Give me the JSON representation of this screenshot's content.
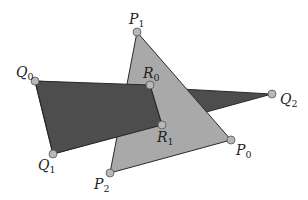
{
  "diagram": {
    "colors": {
      "background": "#ffffff",
      "triangle_p_fill": "#a9a9a9",
      "triangle_q_fill": "#4d4d4d",
      "edge_stroke": "#2a2a2a",
      "vertex_fill": "#b8b8b8",
      "vertex_stroke": "#555555",
      "label_color": "#222222"
    },
    "triangle_q": {
      "name": "Q",
      "vertices": [
        {
          "id": "Q0",
          "x": 35,
          "y": 81
        },
        {
          "id": "Q1",
          "x": 53,
          "y": 154
        },
        {
          "id": "Q2",
          "x": 272,
          "y": 94
        }
      ]
    },
    "triangle_p": {
      "name": "P",
      "vertices": [
        {
          "id": "P0",
          "x": 231,
          "y": 140
        },
        {
          "id": "P1",
          "x": 137,
          "y": 32
        },
        {
          "id": "P2",
          "x": 110,
          "y": 173
        }
      ]
    },
    "intersections": [
      {
        "id": "R0",
        "x": 150,
        "y": 85
      },
      {
        "id": "R1",
        "x": 162,
        "y": 125
      }
    ],
    "labels": [
      {
        "id": "P1",
        "letter": "P",
        "sub": "1",
        "x": 129,
        "y": 24
      },
      {
        "id": "Q0",
        "letter": "Q",
        "sub": "0",
        "x": 16,
        "y": 77
      },
      {
        "id": "R0",
        "letter": "R",
        "sub": "0",
        "x": 143,
        "y": 78
      },
      {
        "id": "Q2",
        "letter": "Q",
        "sub": "2",
        "x": 280,
        "y": 104
      },
      {
        "id": "R1",
        "letter": "R",
        "sub": "1",
        "x": 157,
        "y": 142
      },
      {
        "id": "P0",
        "letter": "P",
        "sub": "0",
        "x": 236,
        "y": 155
      },
      {
        "id": "Q1",
        "letter": "Q",
        "sub": "1",
        "x": 38,
        "y": 170
      },
      {
        "id": "P2",
        "letter": "P",
        "sub": "2",
        "x": 94,
        "y": 189
      }
    ]
  }
}
